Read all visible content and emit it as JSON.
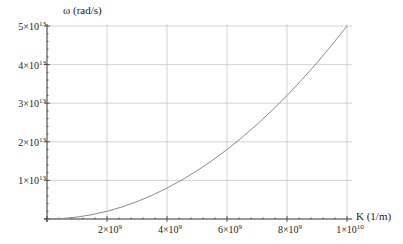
{
  "chart_data": {
    "type": "line",
    "title": "",
    "xlabel": "K (1/m)",
    "ylabel": "ω (rad/s)",
    "xlim": [
      0,
      10000000000
    ],
    "ylim": [
      0,
      50000000000000
    ],
    "grid": true,
    "legend": null,
    "x_ticks": [
      {
        "value": 2000000000,
        "mantissa": "2",
        "exp": "9"
      },
      {
        "value": 4000000000,
        "mantissa": "4",
        "exp": "9"
      },
      {
        "value": 6000000000,
        "mantissa": "6",
        "exp": "9"
      },
      {
        "value": 8000000000,
        "mantissa": "8",
        "exp": "9"
      },
      {
        "value": 10000000000,
        "mantissa": "1",
        "exp": "10"
      }
    ],
    "y_ticks": [
      {
        "value": 10000000000000,
        "mantissa": "1",
        "exp": "13"
      },
      {
        "value": 20000000000000,
        "mantissa": "2",
        "exp": "13"
      },
      {
        "value": 30000000000000,
        "mantissa": "3",
        "exp": "13"
      },
      {
        "value": 40000000000000,
        "mantissa": "4",
        "exp": "13"
      },
      {
        "value": 50000000000000,
        "mantissa": "5",
        "exp": "13"
      }
    ],
    "series": [
      {
        "name": "ω(K)",
        "x": [
          0,
          500000000,
          1000000000,
          1500000000,
          2000000000,
          2500000000,
          3000000000,
          3500000000,
          4000000000,
          4500000000,
          5000000000,
          5500000000,
          6000000000,
          6500000000,
          7000000000,
          7500000000,
          8000000000,
          8500000000,
          9000000000,
          9500000000,
          10000000000
        ],
        "y": [
          0,
          125000000000,
          500000000000,
          1125000000000,
          2000000000000,
          3125000000000,
          4500000000000,
          6125000000000,
          8000000000000,
          10125000000000,
          12500000000000,
          15125000000000,
          18000000000000,
          21125000000000,
          24500000000000,
          28125000000000,
          32000000000000,
          36125000000000,
          40500000000000,
          45125000000000,
          50000000000000
        ]
      }
    ]
  }
}
